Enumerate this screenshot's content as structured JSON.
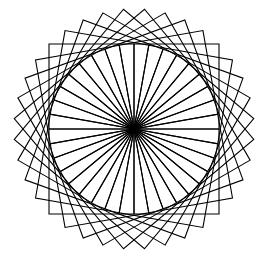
{
  "figure": {
    "background": "#ffffff",
    "stroke": "#000000",
    "stroke_width": 1.1,
    "center": [
      134,
      129
    ],
    "square_side": 85,
    "square_count": 36,
    "rotation_step_deg": 10
  }
}
